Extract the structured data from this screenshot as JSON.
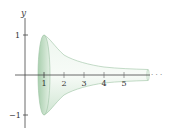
{
  "figure": {
    "axis_label_y": "y",
    "x_ticks": [
      "1",
      "2",
      "3",
      "4",
      "5"
    ],
    "y_ticks": [
      "1",
      "−1"
    ],
    "continuation": "· · ·",
    "colors": {
      "surface_fill": "#d6ead8",
      "surface_dark": "#a9cfae",
      "surface_edge": "#9cc3a2",
      "axis": "#444444"
    }
  }
}
